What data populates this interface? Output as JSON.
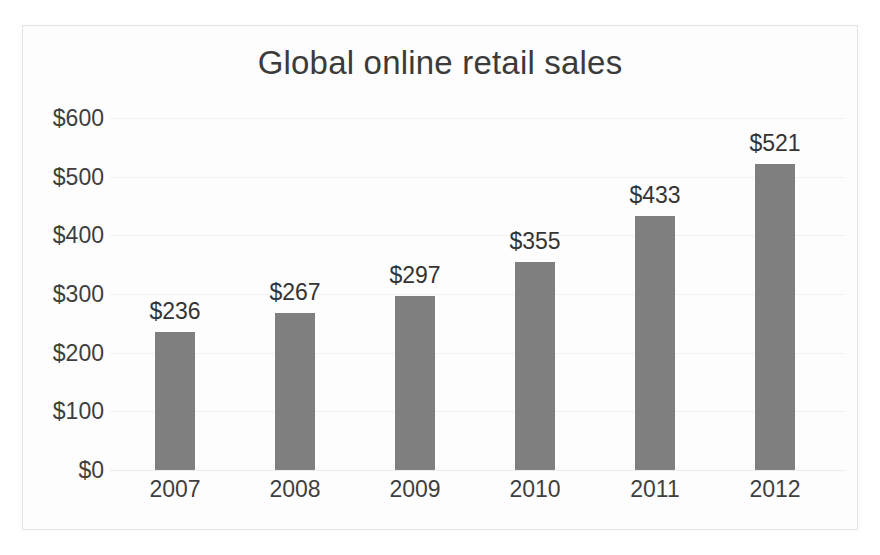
{
  "chart_data": {
    "type": "bar",
    "title": "Global online retail sales",
    "xlabel": "",
    "ylabel": "",
    "categories": [
      "2007",
      "2008",
      "2009",
      "2010",
      "2011",
      "2012"
    ],
    "values": [
      236,
      267,
      297,
      355,
      433,
      521
    ],
    "data_labels": [
      "$236",
      "$267",
      "$297",
      "$355",
      "$433",
      "$521"
    ],
    "ylim": [
      0,
      600
    ],
    "ytick_values": [
      600,
      500,
      400,
      300,
      200,
      100,
      0
    ],
    "ytick_labels": [
      "$600",
      "$500",
      "$400",
      "$300",
      "$200",
      "$100",
      "$0"
    ],
    "grid": "horizontal",
    "legend": "none",
    "series": [
      {
        "name": "Global online retail sales",
        "values": [
          236,
          267,
          297,
          355,
          433,
          521
        ]
      }
    ],
    "colors": {
      "bar": "#7f7f7f",
      "title_text": "#3b3b3b",
      "tick_text": "#3f3f3f",
      "data_label_text": "#343434",
      "gridline": "#f1f1f1",
      "background": "#fdfdfd",
      "frame_border": "#e2e2e2"
    }
  }
}
